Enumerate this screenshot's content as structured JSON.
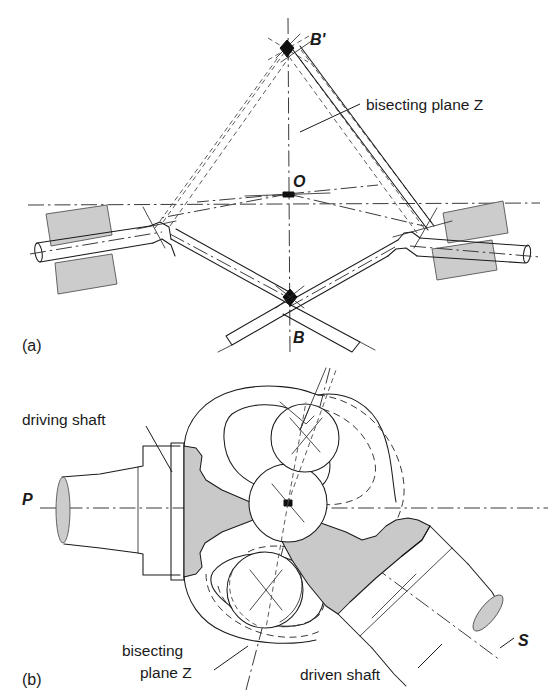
{
  "figure": {
    "colors": {
      "ink": "#1a1a1a",
      "gray_fill": "#c9c9c9",
      "background": "#ffffff"
    }
  },
  "panel_a": {
    "caption": "(a)",
    "labels": {
      "b_prime": "B'",
      "o": "O",
      "b": "B",
      "bisecting_plane": "bisecting plane Z"
    },
    "geometry": {
      "o_point": [
        288,
        194
      ],
      "b_prime_point": [
        287,
        48
      ],
      "b_point": [
        290,
        297
      ],
      "left_joint": [
        160,
        218
      ],
      "right_joint": [
        420,
        226
      ]
    }
  },
  "panel_b": {
    "caption": "(b)",
    "labels": {
      "driving_shaft": "driving shaft",
      "driven_shaft": "driven shaft",
      "bisecting_plane_line1": "bisecting",
      "bisecting_plane_line2": "plane Z",
      "p": "P",
      "s": "S"
    },
    "geometry": {
      "centre_ball": [
        288,
        503
      ],
      "upper_ball": [
        305,
        438
      ],
      "lower_ball": [
        265,
        590
      ],
      "axis_p_y": 508
    }
  }
}
